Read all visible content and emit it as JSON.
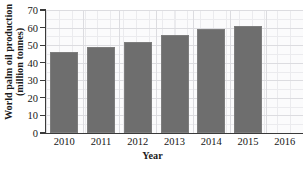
{
  "caption_fragment": "· · ·  · · · ·   · ·  · · ·   · ·· · ·",
  "chart_data": {
    "type": "bar",
    "title": "",
    "categories": [
      "2010",
      "2011",
      "2012",
      "2013",
      "2014",
      "2015",
      "2016"
    ],
    "values": [
      46,
      49,
      52,
      56,
      59,
      61,
      null
    ],
    "series": [
      {
        "name": "World palm oil production",
        "values": [
          46,
          49,
          52,
          56,
          59,
          61,
          null
        ]
      }
    ],
    "xlabel": "Year",
    "ylabel_line1": "World palm oil production",
    "ylabel_line2": "(million tonnes)",
    "ylabel": "World palm oil production (million tonnes)",
    "ylim": [
      0,
      70
    ],
    "ytick_labels": [
      "0",
      "10",
      "20",
      "30",
      "40",
      "50",
      "60",
      "70"
    ],
    "ytick_values": [
      0,
      10,
      20,
      30,
      40,
      50,
      60,
      70
    ],
    "xtick_labels": [
      "2010",
      "2011",
      "2012",
      "2013",
      "2014",
      "2015",
      "2016"
    ],
    "grid": true,
    "minor_grid": true,
    "legend": "none",
    "units": "million tonnes",
    "colors": {
      "bar_fill": "#6e6e6e",
      "bar_edge": "#7d7d7d",
      "plot_background": "#fbfbfc",
      "grid_major": "#dcdce0",
      "grid_minor": "#e9e9ec",
      "axis": "#3a3a3a",
      "text": "#161616"
    }
  }
}
